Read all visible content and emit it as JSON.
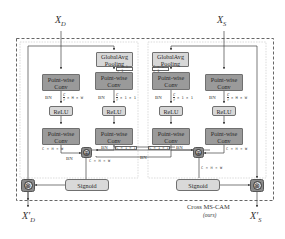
{
  "diagram": {
    "title": "Cross MS-CAM",
    "subtitle": "(ours)",
    "inputs": {
      "left": {
        "symbol": "X",
        "sub": "D"
      },
      "right": {
        "symbol": "X",
        "sub": "S"
      }
    },
    "outputs": {
      "left": {
        "symbol": "X′",
        "sub": "D"
      },
      "right": {
        "symbol": "X′",
        "sub": "S"
      }
    },
    "left_branch": {
      "local_path": [
        "Point-wise Conv",
        "ReLU",
        "Point-wise Conv"
      ],
      "global_path": [
        "GlobalAvg Pooling",
        "Point-wise Conv",
        "ReLU",
        "Point-wise Conv"
      ]
    },
    "right_branch": {
      "global_path": [
        "GlobalAvg Pooling",
        "Point-wise Conv",
        "ReLU",
        "Point-wise Conv"
      ],
      "local_path": [
        "Point-wise Conv",
        "ReLU",
        "Point-wise Conv"
      ]
    },
    "labels": {
      "conv_line1": "Point-wise",
      "conv_line2": "Conv",
      "relu": "ReLU",
      "gap_line1": "GlobalAvg",
      "gap_line2": "Pooling",
      "sigmoid": "Signoid",
      "bn": "BN",
      "dim_c11": "C × 1 × 1",
      "dim_chw": "C × H × W",
      "dim_r11": "× 1 × 1",
      "dim_rhw": "× H × W",
      "frac_num": "C",
      "frac_den": "r",
      "add_symbol": "⊕",
      "mul_symbol": "⊗"
    },
    "colors": {
      "conv_fill": "#9a9a9a",
      "light_fill": "#d7d7d7",
      "op_fill": "#8a8a8a",
      "line": "#555555",
      "dashed": "#555555",
      "dotted_inner": "#bdbdbd"
    }
  }
}
